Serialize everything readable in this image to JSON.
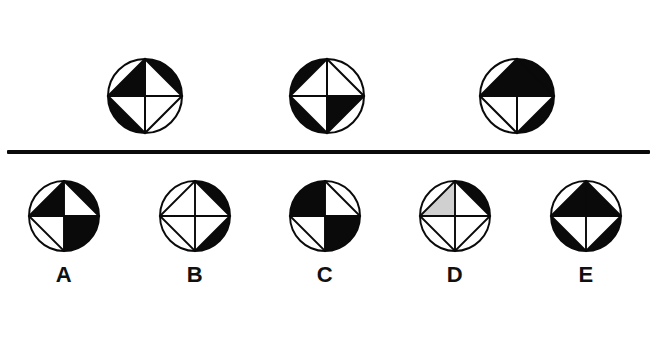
{
  "page": {
    "type": "visual-reasoning-puzzle",
    "background_color": "#ffffff",
    "ink_color": "#0a0a0a",
    "gray_color": "#d0d0d0",
    "width": 657,
    "height": 344
  },
  "divider": {
    "name": "horizontal-rule",
    "x": 7,
    "y": 150,
    "width": 643,
    "thickness": 4,
    "color": "#0a0a0a"
  },
  "question_row": {
    "label": "question-figures",
    "count": 3,
    "figures": [
      {
        "id": "question-figure-1",
        "cx": 145,
        "cy": 96,
        "r": 37,
        "inner_triangles": {
          "north": "black",
          "east": "white",
          "south": "white",
          "west": "white"
        },
        "outer_segments": {
          "top_right": "black",
          "bottom_right": "white",
          "bottom_left": "black",
          "top_left": "white"
        }
      },
      {
        "id": "question-figure-2",
        "cx": 327,
        "cy": 96,
        "r": 37,
        "inner_triangles": {
          "north": "white",
          "east": "white",
          "south": "black",
          "west": "white"
        },
        "outer_segments": {
          "top_right": "white",
          "bottom_right": "white",
          "bottom_left": "black",
          "top_left": "black"
        }
      },
      {
        "id": "question-figure-3",
        "cx": 517,
        "cy": 96,
        "r": 37,
        "inner_triangles": {
          "north": "black",
          "east": "black",
          "south": "white",
          "west": "white"
        },
        "outer_segments": {
          "top_right": "black",
          "bottom_right": "black",
          "bottom_left": "white",
          "top_left": "white"
        }
      }
    ]
  },
  "options_row": {
    "label": "answer-options",
    "count": 5,
    "options": [
      {
        "id": "option-a",
        "letter": "A",
        "cx": 64,
        "cy": 216,
        "r": 35,
        "inner_triangles": {
          "north": "black",
          "east": "white",
          "south": "black",
          "west": "white"
        },
        "outer_segments": {
          "top_right": "black",
          "bottom_right": "black",
          "bottom_left": "white",
          "top_left": "white"
        }
      },
      {
        "id": "option-b",
        "letter": "B",
        "cx": 195,
        "cy": 216,
        "r": 35,
        "inner_triangles": {
          "north": "white",
          "east": "white",
          "south": "white",
          "west": "white"
        },
        "outer_segments": {
          "top_right": "black",
          "bottom_right": "black",
          "bottom_left": "white",
          "top_left": "white"
        }
      },
      {
        "id": "option-c",
        "letter": "C",
        "cx": 325,
        "cy": 216,
        "r": 35,
        "inner_triangles": {
          "north": "black",
          "east": "white",
          "south": "black",
          "west": "white"
        },
        "outer_segments": {
          "top_right": "white",
          "bottom_right": "black",
          "bottom_left": "white",
          "top_left": "black"
        }
      },
      {
        "id": "option-d",
        "letter": "D",
        "cx": 455,
        "cy": 216,
        "r": 35,
        "inner_triangles": {
          "north": "gray",
          "east": "white",
          "south": "white",
          "west": "white"
        },
        "outer_segments": {
          "top_right": "black",
          "bottom_right": "white",
          "bottom_left": "white",
          "top_left": "white"
        }
      },
      {
        "id": "option-e",
        "letter": "E",
        "cx": 586,
        "cy": 216,
        "r": 35,
        "inner_triangles": {
          "north": "black",
          "east": "black",
          "south": "white",
          "west": "white"
        },
        "outer_segments": {
          "top_right": "white",
          "bottom_right": "black",
          "bottom_left": "black",
          "top_left": "white"
        }
      }
    ]
  },
  "labels": [
    {
      "id": "label-a",
      "text": "A",
      "x": 64
    },
    {
      "id": "label-b",
      "text": "B",
      "x": 195
    },
    {
      "id": "label-c",
      "text": "C",
      "x": 325
    },
    {
      "id": "label-d",
      "text": "D",
      "x": 455
    },
    {
      "id": "label-e",
      "text": "E",
      "x": 586
    }
  ]
}
